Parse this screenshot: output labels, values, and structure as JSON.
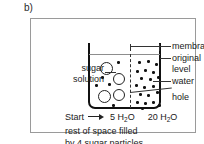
{
  "figure": {
    "part_label": "b)"
  },
  "diagram": {
    "title_hidden": "",
    "left_label": "sugar\nsolution",
    "left_label_line1": "sugar",
    "left_label_line2": "solution",
    "callouts": [
      {
        "id": "membrane",
        "label": "membrane"
      },
      {
        "id": "original-level-1",
        "label": "original"
      },
      {
        "id": "original-level-2",
        "label": "level"
      },
      {
        "id": "water",
        "label": "water"
      },
      {
        "id": "hole",
        "label": "hole"
      }
    ],
    "compartments": {
      "left": {
        "name": "sugar solution",
        "water_count": 5,
        "sugar_count": 4,
        "amount_label": "5 H",
        "amount_sub": "2",
        "amount_suffix": "O"
      },
      "right": {
        "name": "water",
        "water_count": 20,
        "sugar_count": 0,
        "amount_label": "20 H",
        "amount_sub": "2",
        "amount_suffix": "O"
      }
    }
  },
  "caption": {
    "start_label": "Start",
    "arrow_icon": "right-arrow-icon",
    "line2": "rest of space filled",
    "line3": "by 4 sugar particles"
  },
  "colors": {
    "ink": "#111111",
    "panel_border": "#9a9a9a",
    "level_line": "#8d8d8d",
    "background": "#ffffff"
  },
  "chart_data": {
    "type": "diagram",
    "categories": [
      "5 H2O",
      "20 H2O"
    ],
    "values": [
      5,
      20
    ],
    "series": [
      {
        "name": "water particles",
        "values": [
          5,
          20
        ]
      },
      {
        "name": "sugar particles",
        "values": [
          4,
          0
        ]
      }
    ],
    "annotations": [
      "membrane",
      "original level",
      "water",
      "hole",
      "sugar solution",
      "Start"
    ],
    "left_particle_positions": [
      {
        "type": "sugar",
        "x": 8,
        "y": 5,
        "r": 6.5
      },
      {
        "type": "sugar",
        "x": 21,
        "y": 16,
        "r": 6.0
      },
      {
        "type": "sugar",
        "x": 6,
        "y": 33,
        "r": 6.5
      },
      {
        "type": "sugar",
        "x": 21,
        "y": 32,
        "r": 6.0
      },
      {
        "type": "water",
        "x": 25,
        "y": 4
      },
      {
        "type": "water",
        "x": 9,
        "y": 19
      },
      {
        "type": "water",
        "x": 3,
        "y": 27
      },
      {
        "type": "water",
        "x": 16,
        "y": 26
      },
      {
        "type": "water",
        "x": 20,
        "y": 47
      }
    ],
    "right_particle_positions": [
      {
        "type": "water",
        "x": 5,
        "y": 4
      },
      {
        "type": "water",
        "x": 14,
        "y": 3
      },
      {
        "type": "water",
        "x": 22,
        "y": 6
      },
      {
        "type": "water",
        "x": 3,
        "y": 13
      },
      {
        "type": "water",
        "x": 11,
        "y": 12
      },
      {
        "type": "water",
        "x": 19,
        "y": 14
      },
      {
        "type": "water",
        "x": 7,
        "y": 20
      },
      {
        "type": "water",
        "x": 16,
        "y": 21
      },
      {
        "type": "water",
        "x": 24,
        "y": 19
      },
      {
        "type": "water",
        "x": 2,
        "y": 27
      },
      {
        "type": "water",
        "x": 10,
        "y": 29
      },
      {
        "type": "water",
        "x": 19,
        "y": 28
      },
      {
        "type": "water",
        "x": 6,
        "y": 36
      },
      {
        "type": "water",
        "x": 14,
        "y": 37
      },
      {
        "type": "water",
        "x": 23,
        "y": 34
      },
      {
        "type": "water",
        "x": 3,
        "y": 44
      },
      {
        "type": "water",
        "x": 11,
        "y": 45
      },
      {
        "type": "water",
        "x": 19,
        "y": 44
      },
      {
        "type": "water",
        "x": 25,
        "y": 47
      },
      {
        "type": "water",
        "x": 8,
        "y": 50
      }
    ]
  }
}
